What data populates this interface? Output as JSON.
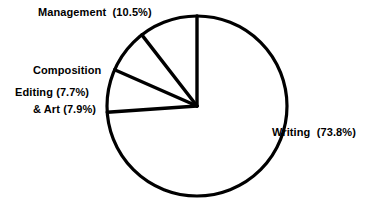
{
  "chart_data": {
    "type": "pie",
    "title": "",
    "subtitle": "",
    "xlabel": "",
    "ylabel": "",
    "grid": false,
    "legend_position": "none",
    "label_format": "name (percent%)",
    "start_angle_deg": 0,
    "direction": "counterclockwise",
    "center": [
      197,
      106
    ],
    "radius": 90,
    "categories": [
      "Management",
      "Composition & Art",
      "Editing",
      "Writing"
    ],
    "values": [
      10.5,
      7.9,
      7.7,
      73.8
    ],
    "units": "percent",
    "slices": [
      {
        "name": "Management",
        "percent": 10.5,
        "label": "Management  (10.5%)",
        "fill": "#ffffff",
        "stroke": "#000000"
      },
      {
        "name": "Composition & Art",
        "percent": 7.9,
        "label_line1": "Composition",
        "label_line2": "& Art (7.9%)",
        "fill": "#ffffff",
        "stroke": "#000000"
      },
      {
        "name": "Editing",
        "percent": 7.7,
        "label": "Editing (7.7%)",
        "fill": "#ffffff",
        "stroke": "#000000"
      },
      {
        "name": "Writing",
        "percent": 73.8,
        "label": "Writing  (73.8%)",
        "fill": "#ffffff",
        "stroke": "#000000"
      }
    ]
  },
  "colors": {
    "background": "#ffffff",
    "stroke": "#000000",
    "text": "#000000"
  },
  "labels": {
    "management": "Management  (10.5%)",
    "composition_line1": "Composition",
    "composition_line2": "& Art (7.9%)",
    "editing": "Editing (7.7%)",
    "writing": "Writing  (73.8%)"
  }
}
